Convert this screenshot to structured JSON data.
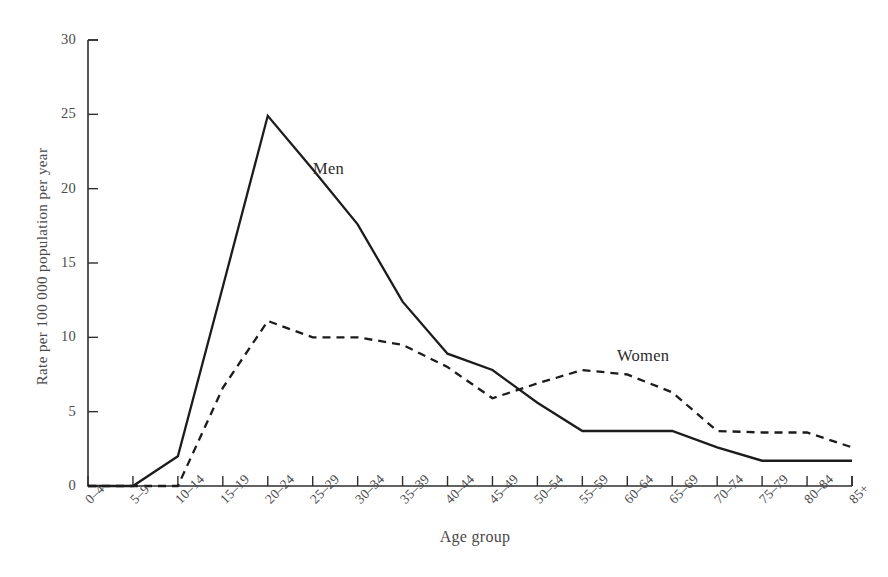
{
  "chart_data": {
    "type": "line",
    "title": "",
    "subtitle": "",
    "xlabel": "Age group",
    "ylabel": "Rate per 100 000 population per year",
    "categories": [
      "0–4",
      "5–9",
      "10–14",
      "15–19",
      "20–24",
      "25–29",
      "30–34",
      "35–39",
      "40–44",
      "45–49",
      "50–54",
      "55–59",
      "60–64",
      "65–69",
      "70–74",
      "75–79",
      "80–84",
      "85+"
    ],
    "ylim": [
      0,
      30
    ],
    "yticks": [
      0,
      5,
      10,
      15,
      20,
      25,
      30
    ],
    "ytick_labels": [
      "0",
      "5",
      "10",
      "15",
      "20",
      "25",
      "30"
    ],
    "grid": false,
    "legend_position": "inline-annotations",
    "series": [
      {
        "name": "Men",
        "style": "solid",
        "color": "#1c1c1c",
        "annotation": "Men",
        "values": [
          0,
          0,
          2.0,
          13.4,
          24.9,
          21.3,
          17.6,
          12.4,
          8.9,
          7.8,
          5.6,
          3.7,
          3.7,
          3.7,
          2.6,
          1.7,
          1.7,
          1.7
        ]
      },
      {
        "name": "Women",
        "style": "dashed",
        "color": "#1c1c1c",
        "annotation": "Women",
        "values": [
          0,
          0,
          0,
          6.6,
          11.1,
          10.0,
          10.0,
          9.5,
          8.0,
          5.9,
          6.9,
          7.8,
          7.5,
          6.3,
          3.7,
          3.6,
          3.6,
          2.6
        ]
      }
    ]
  }
}
